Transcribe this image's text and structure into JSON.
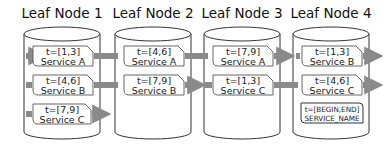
{
  "diagram": {
    "nodes": [
      {
        "title": "Leaf Node 1",
        "entries": [
          {
            "time": "t=[1,3]",
            "service": "Service A"
          },
          {
            "time": "t=[4,6]",
            "service": "Service B"
          },
          {
            "time": "t=[7,9]",
            "service": "Service C"
          }
        ]
      },
      {
        "title": "Leaf Node 2",
        "entries": [
          {
            "time": "t=[4,6]",
            "service": "Service A"
          },
          {
            "time": "t=[7,9]",
            "service": "Service B"
          }
        ]
      },
      {
        "title": "Leaf Node 3",
        "entries": [
          {
            "time": "t=[7,9]",
            "service": "Service A"
          },
          {
            "time": "t=[1,3]",
            "service": "Service C"
          }
        ]
      },
      {
        "title": "Leaf Node 4",
        "entries": [
          {
            "time": "t=[1,3]",
            "service": "Service B"
          },
          {
            "time": "t=[4,6]",
            "service": "Service C"
          }
        ]
      }
    ],
    "legend": {
      "time": "t=[BEGIN,END]",
      "service": "SERVICE_NAME"
    },
    "colors": {
      "arrow": "#8a8a8a",
      "outline": "#333333",
      "box_border": "#555555"
    }
  }
}
